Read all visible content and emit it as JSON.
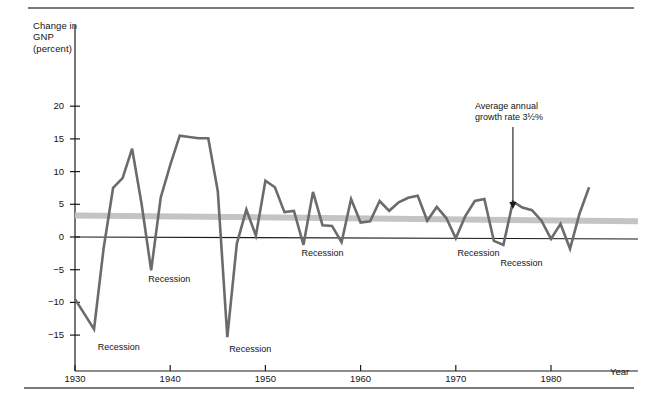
{
  "axes": {
    "y_title": "Change in\nGNP\n(percent)",
    "x_title": "Year",
    "y_ticks": [
      20,
      15,
      10,
      5,
      0,
      -5,
      -10,
      -15
    ],
    "y_tick_labels": [
      "20",
      "15",
      "10",
      "5",
      "0",
      "−5",
      "−10",
      "−15"
    ],
    "x_ticks": [
      1930,
      1940,
      1950,
      1960,
      1970,
      1980
    ],
    "x_tick_labels": [
      "1930",
      "1940",
      "1950",
      "1960",
      "1970",
      "1980"
    ],
    "xlim": [
      1930,
      1985
    ],
    "ylim": [
      -17,
      25
    ]
  },
  "annotation": {
    "text": "Average annual\ngrowth rate 3½%",
    "target_year": 1976,
    "target_value": 4.3
  },
  "recession_labels": [
    {
      "text": "Recession",
      "year": 1932.6,
      "value": -17.0
    },
    {
      "text": "Recession",
      "year": 1937.9,
      "value": -6.6
    },
    {
      "text": "Recession",
      "year": 1946.4,
      "value": -17.3
    },
    {
      "text": "Recession",
      "year": 1954.0,
      "value": -2.6
    },
    {
      "text": "Recession",
      "year": 1970.4,
      "value": -2.6
    },
    {
      "text": "Recession",
      "year": 1974.9,
      "value": -4.2
    }
  ],
  "colors": {
    "line": "#6b6b6b",
    "trend_band": "#c4c4c4",
    "axis": "#1a1a1a",
    "rule": "#7a7a7a",
    "text": "#131313"
  },
  "chart_data": {
    "type": "line",
    "title": "",
    "subtitle": "",
    "xlabel": "Year",
    "ylabel": "Change in GNP (percent)",
    "xlim": [
      1930,
      1985
    ],
    "ylim": [
      -17,
      25
    ],
    "grid": false,
    "legend": null,
    "series": [
      {
        "name": "Change in GNP (percent)",
        "color": "#6b6b6b",
        "x": [
          1930,
          1931,
          1932,
          1933,
          1934,
          1935,
          1936,
          1937,
          1938,
          1939,
          1940,
          1941,
          1942,
          1943,
          1944,
          1945,
          1946,
          1947,
          1948,
          1949,
          1950,
          1951,
          1952,
          1953,
          1954,
          1955,
          1956,
          1957,
          1958,
          1959,
          1960,
          1961,
          1962,
          1963,
          1964,
          1965,
          1966,
          1967,
          1968,
          1969,
          1970,
          1971,
          1972,
          1973,
          1974,
          1975,
          1976,
          1977,
          1978,
          1979,
          1980,
          1981,
          1982,
          1983,
          1984
        ],
        "y": [
          -9.5,
          -11.8,
          -14.1,
          -1.8,
          7.5,
          9.0,
          13.5,
          5.0,
          -5.1,
          6.0,
          11.0,
          15.5,
          15.3,
          15.1,
          15.1,
          7.0,
          -15.3,
          -1.0,
          4.2,
          0.2,
          8.6,
          7.6,
          3.8,
          4.0,
          -1.2,
          6.9,
          1.8,
          1.7,
          -0.8,
          5.8,
          2.2,
          2.4,
          5.5,
          4.0,
          5.3,
          6.0,
          6.3,
          2.5,
          4.6,
          2.9,
          -0.2,
          3.2,
          5.5,
          5.8,
          -0.6,
          -1.2,
          5.4,
          4.5,
          4.1,
          2.5,
          -0.3,
          2.0,
          -1.8,
          3.6,
          7.6
        ],
        "style": "solid",
        "linewidth": 2.6
      },
      {
        "name": "Average annual growth rate 3½%",
        "color": "#c4c4c4",
        "x": [
          1930,
          1985
        ],
        "y": [
          3.3,
          2.4
        ],
        "style": "band",
        "linewidth": 6
      }
    ]
  }
}
